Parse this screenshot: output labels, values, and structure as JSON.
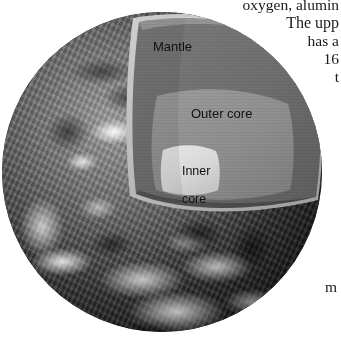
{
  "figure": {
    "name": "earth-internal-structure-cutaway",
    "labels": {
      "mantle": "Mantle",
      "outer_core": "Outer core",
      "inner_core_line1": "Inner",
      "inner_core_line2": "core"
    },
    "colors": {
      "mantle": "#6e6e6e",
      "outer_core": "#8f8f8f",
      "inner_core": "#d8d8d8",
      "crust_rim": "#b9b9b9",
      "surface_dark": "#1b1b1b",
      "background": "#ffffff",
      "text": "#111111"
    }
  },
  "body_text": {
    "lines": [
      "oxygen, alumin",
      "The upp",
      "has a",
      "16",
      "t"
    ],
    "bottom_fragment": "m"
  }
}
